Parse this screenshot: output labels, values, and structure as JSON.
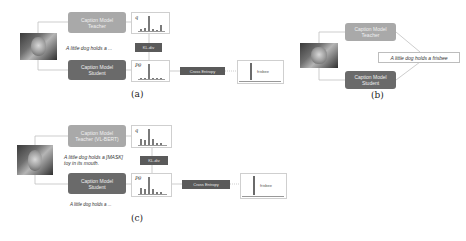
{
  "panel_a": {
    "label": "(a)",
    "teacher": {
      "line1": "Caption Model",
      "line2": "Teacher"
    },
    "student": {
      "line1": "Caption Model",
      "line2": "Student"
    },
    "caption": "A little dog holds a ...",
    "teacher_dist_label": "q",
    "student_dist_label": "Pθ",
    "kl_label": "KL-div",
    "ce_label": "Cross Entropy",
    "target_word": "frisbee",
    "teacher_dist": [
      0.15,
      0.2,
      1.0,
      0.15,
      0.08,
      0.4
    ],
    "student_dist": [
      0.05,
      0.05,
      1.0,
      0.05,
      0.03,
      0.05
    ]
  },
  "panel_b": {
    "label": "(b)",
    "teacher": {
      "line1": "Caption Model",
      "line2": "Teacher"
    },
    "student": {
      "line1": "Caption Model",
      "line2": "Student"
    },
    "caption": "A little dog holds a frisbee"
  },
  "panel_c": {
    "label": "(c)",
    "teacher": {
      "line1": "Caption Model",
      "line2": "Teacher (VL-BERT)"
    },
    "student": {
      "line1": "Caption Model",
      "line2": "Student"
    },
    "teacher_caption_line1": "A little dog holds a [MASK]",
    "teacher_caption_line2": "toy in its mouth.",
    "student_caption": "A little dog holds a ...",
    "teacher_dist_label": "q",
    "student_dist_label": "Pθ",
    "kl_label": "KL-div",
    "ce_label": "Cross Entropy",
    "target_word": "frisbee",
    "teacher_dist": [
      0.35,
      0.3,
      1.0,
      0.35,
      0.1,
      0.15
    ],
    "student_dist": [
      0.35,
      0.3,
      1.0,
      0.3,
      0.1,
      0.1
    ]
  }
}
